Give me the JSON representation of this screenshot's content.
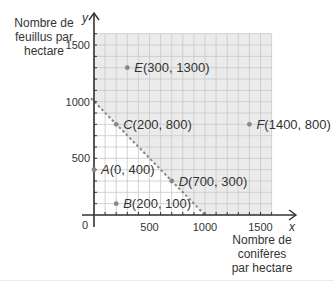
{
  "chart_data": {
    "type": "scatter",
    "title": "",
    "xlabel": "Nombre de conifères par hectare",
    "ylabel": "Nombre de feuillus par hectare",
    "x_axis_symbol": "x",
    "y_axis_symbol": "y",
    "xlim": [
      0,
      1600
    ],
    "ylim": [
      0,
      1600
    ],
    "x_ticks": [
      0,
      500,
      1000,
      1500
    ],
    "y_ticks": [
      0,
      500,
      1000,
      1500
    ],
    "grid": true,
    "grid_step": 100,
    "points": [
      {
        "name": "A",
        "x": 0,
        "y": 400,
        "label": "A(0, 400)"
      },
      {
        "name": "B",
        "x": 200,
        "y": 100,
        "label": "B(200, 100)"
      },
      {
        "name": "C",
        "x": 200,
        "y": 800,
        "label": "C(200, 800)"
      },
      {
        "name": "D",
        "x": 700,
        "y": 300,
        "label": "D(700, 300)"
      },
      {
        "name": "E",
        "x": 300,
        "y": 1300,
        "label": "E(300, 1300)"
      },
      {
        "name": "F",
        "x": 1400,
        "y": 800,
        "label": "F(1400, 800)"
      }
    ],
    "boundary_line": {
      "style": "dashed",
      "from": [
        0,
        1000
      ],
      "to": [
        1000,
        0
      ],
      "equation": "x + y = 1000"
    },
    "shaded_region": "x + y >= 1000"
  },
  "labels": {
    "ylabel_lines": [
      "Nombre de",
      "feuillus par",
      "hectare"
    ],
    "xlabel_lines": [
      "Nombre de",
      "conifères",
      "par hectare"
    ],
    "origin": "0"
  },
  "colors": {
    "shade": "#ebebeb",
    "grid": "#c8c8c8",
    "axis": "#333333",
    "point": "#888888",
    "dashed": "#888888"
  }
}
